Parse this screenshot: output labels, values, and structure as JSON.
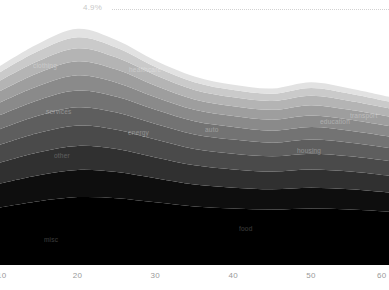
{
  "reference": {
    "label": "4.9%",
    "value": 4.9
  },
  "axis": {
    "ticks": [
      "10",
      "20",
      "30",
      "40",
      "50",
      "60"
    ]
  },
  "chart_data": {
    "type": "area",
    "title": "",
    "subtitle": "",
    "xlabel": "",
    "ylabel": "",
    "stacked": true,
    "grid": false,
    "legend": "inline-labels",
    "xlim": [
      10,
      60
    ],
    "ylim": [
      0,
      4.9
    ],
    "x": [
      10,
      15,
      20,
      25,
      30,
      35,
      40,
      45,
      50,
      55,
      60
    ],
    "annotations": [
      {
        "text": "4.9%",
        "type": "reference-line",
        "y": 4.9,
        "style": "dotted"
      }
    ],
    "tick_labels": {
      "x": [
        "10",
        "20",
        "30",
        "40",
        "50",
        "60"
      ]
    },
    "series": [
      {
        "name": "food",
        "color": "#000000",
        "label_x": 239,
        "label_y": 225,
        "values": [
          1.1,
          1.22,
          1.3,
          1.28,
          1.2,
          1.12,
          1.08,
          1.06,
          1.08,
          1.06,
          1.02
        ]
      },
      {
        "name": "misc",
        "color": "#0e0e0e",
        "label_x": 44,
        "label_y": 236,
        "values": [
          0.46,
          0.5,
          0.52,
          0.5,
          0.46,
          0.42,
          0.4,
          0.39,
          0.4,
          0.39,
          0.37
        ]
      },
      {
        "name": "other",
        "color": "#303030",
        "label_x": 54,
        "label_y": 152,
        "values": [
          0.4,
          0.44,
          0.46,
          0.44,
          0.4,
          0.37,
          0.35,
          0.34,
          0.35,
          0.34,
          0.32
        ]
      },
      {
        "name": "energy",
        "color": "#4a4a4a",
        "label_x": 128,
        "label_y": 129,
        "values": [
          0.34,
          0.37,
          0.39,
          0.37,
          0.34,
          0.31,
          0.3,
          0.29,
          0.3,
          0.29,
          0.28
        ]
      },
      {
        "name": "auto",
        "color": "#5e5e5e",
        "label_x": 205,
        "label_y": 126,
        "values": [
          0.3,
          0.33,
          0.35,
          0.33,
          0.3,
          0.28,
          0.27,
          0.26,
          0.27,
          0.26,
          0.25
        ]
      },
      {
        "name": "services",
        "color": "#737373",
        "label_x": 46,
        "label_y": 108,
        "values": [
          0.27,
          0.3,
          0.32,
          0.3,
          0.27,
          0.25,
          0.24,
          0.23,
          0.24,
          0.23,
          0.22
        ]
      },
      {
        "name": "housing",
        "color": "#8a8a8a",
        "label_x": 297,
        "label_y": 147,
        "values": [
          0.24,
          0.27,
          0.29,
          0.27,
          0.24,
          0.22,
          0.21,
          0.21,
          0.22,
          0.21,
          0.2
        ]
      },
      {
        "name": "clothing",
        "color": "#9e9e9e",
        "label_x": 33,
        "label_y": 62,
        "values": [
          0.22,
          0.25,
          0.27,
          0.25,
          0.22,
          0.2,
          0.19,
          0.19,
          0.2,
          0.19,
          0.18
        ]
      },
      {
        "name": "healthcare",
        "color": "#b4b4b4",
        "label_x": 129,
        "label_y": 66,
        "values": [
          0.2,
          0.23,
          0.25,
          0.23,
          0.2,
          0.18,
          0.17,
          0.17,
          0.18,
          0.17,
          0.16
        ]
      },
      {
        "name": "education",
        "color": "#cacaca",
        "label_x": 320,
        "label_y": 118,
        "values": [
          0.16,
          0.19,
          0.21,
          0.19,
          0.16,
          0.15,
          0.14,
          0.14,
          0.15,
          0.14,
          0.13
        ]
      },
      {
        "name": "transport",
        "color": "#e2e2e2",
        "label_x": 350,
        "label_y": 112,
        "values": [
          0.12,
          0.14,
          0.16,
          0.14,
          0.12,
          0.11,
          0.1,
          0.1,
          0.11,
          0.1,
          0.09
        ]
      }
    ]
  }
}
